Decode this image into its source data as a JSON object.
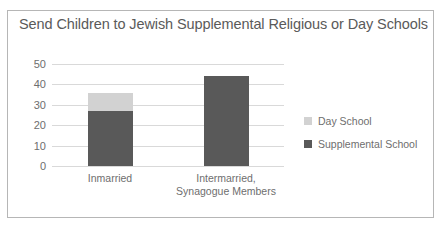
{
  "chart": {
    "title": "Send Children to Jewish Supplemental Religious or Day Schools"
  },
  "chart_data": {
    "type": "bar",
    "stacked": true,
    "title": "Send Children to Jewish Supplemental Religious or Day Schools",
    "xlabel": "",
    "ylabel": "",
    "ylim": [
      0,
      50
    ],
    "yticks": [
      0,
      10,
      20,
      30,
      40,
      50
    ],
    "ytick_labels": [
      "0",
      "10",
      "20",
      "30",
      "40",
      "50"
    ],
    "grid": true,
    "legend_position": "right",
    "categories": [
      "Inmarried",
      "Intermarried,\nSynagogue Members"
    ],
    "category_lines": [
      [
        "Inmarried"
      ],
      [
        "Intermarried,",
        "Synagogue Members"
      ]
    ],
    "series": [
      {
        "name": "Supplemental School",
        "color": "#595959",
        "values": [
          27,
          44
        ]
      },
      {
        "name": "Day School",
        "color": "#d2d2d2",
        "values": [
          9,
          0
        ]
      }
    ],
    "totals": [
      36,
      44
    ]
  },
  "legend": {
    "items": [
      {
        "label": "Day School",
        "color": "#d2d2d2"
      },
      {
        "label": "Supplemental School",
        "color": "#595959"
      }
    ]
  },
  "colors": {
    "day_school": "#d2d2d2",
    "supplemental_school": "#595959",
    "gridline": "#d9d9d9",
    "text": "#6e6e6e",
    "frame": "#b6b6b6"
  }
}
